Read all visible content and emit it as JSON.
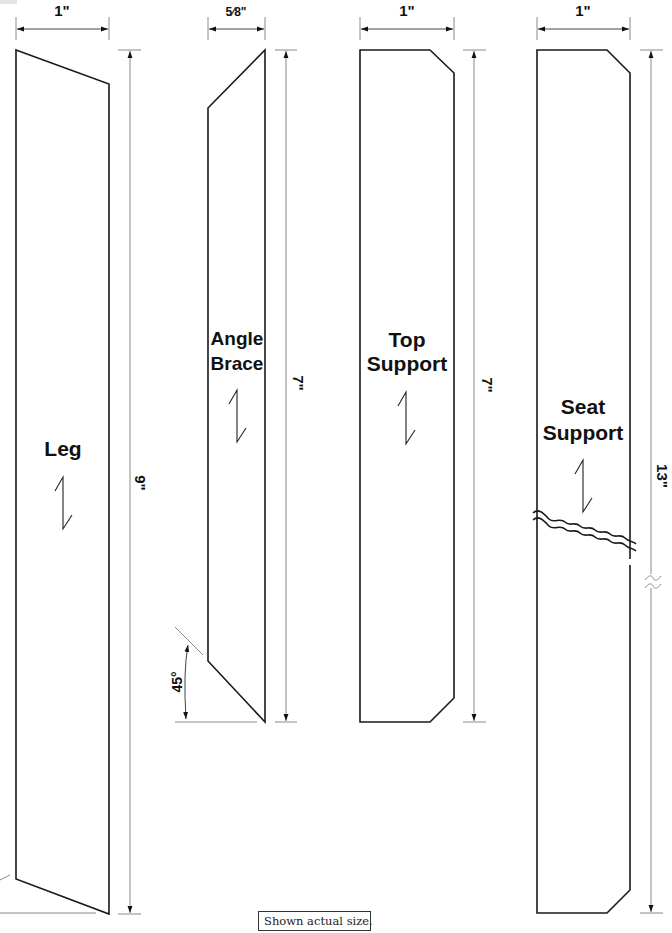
{
  "drawing": {
    "parts": [
      {
        "name": "Leg",
        "label_lines": [
          "Leg"
        ],
        "width_dim": "1\"",
        "length_dim": "9\""
      },
      {
        "name": "Angle Brace",
        "label_lines": [
          "Angle",
          "Brace"
        ],
        "width_dim": "5⁄8\"",
        "length_dim": "7\"",
        "angle_dim": "45°"
      },
      {
        "name": "Top Support",
        "label_lines": [
          "Top",
          "Support"
        ],
        "width_dim": "1\"",
        "length_dim": "7\""
      },
      {
        "name": "Seat Support",
        "label_lines": [
          "Seat",
          "Support"
        ],
        "width_dim": "1\"",
        "length_dim": "13\""
      }
    ],
    "note": "Shown actual size.",
    "colors": {
      "outline": "#1a1a1a",
      "dimension_line": "#8a8a8a",
      "background": "#ffffff"
    }
  }
}
